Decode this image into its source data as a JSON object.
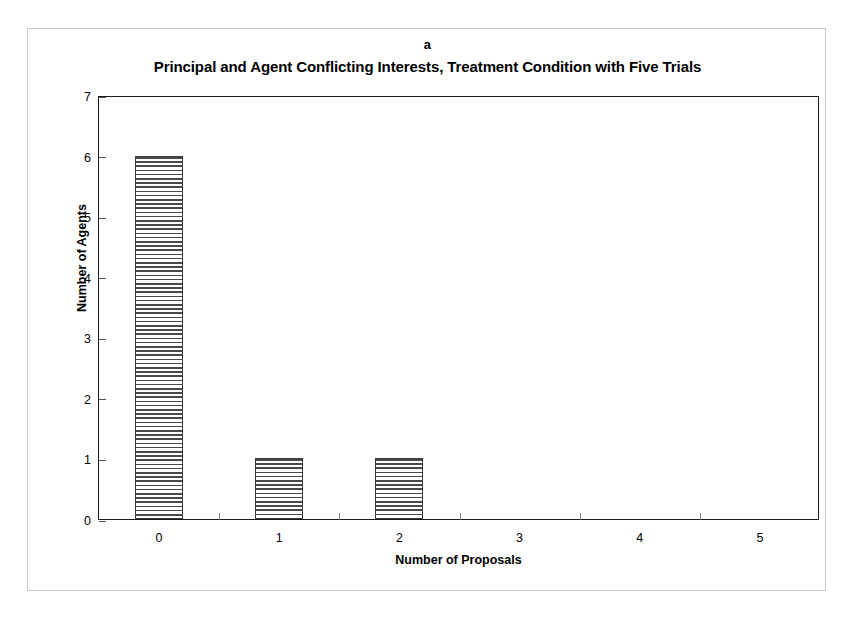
{
  "figure": {
    "panel_label": "a",
    "title": "Principal and Agent Conflicting Interests, Treatment Condition with Five Trials"
  },
  "chart_data": {
    "type": "bar",
    "title": "Principal and Agent Conflicting Interests, Treatment Condition with Five Trials",
    "panel_label": "a",
    "xlabel": "Number of Proposals",
    "ylabel": "Number of Agents",
    "categories": [
      "0",
      "1",
      "2",
      "3",
      "4",
      "5"
    ],
    "values": [
      6,
      1,
      1,
      0,
      0,
      0
    ],
    "ylim": [
      0,
      7
    ],
    "yticks": [
      "0",
      "1",
      "2",
      "3",
      "4",
      "5",
      "6",
      "7"
    ],
    "xtick_labels": [
      "0",
      "1",
      "2",
      "3",
      "4",
      "5"
    ],
    "grid": false,
    "legend": null,
    "bar_fill": "horizontal-hatch",
    "bar_edge_color": "#3a3a3a",
    "axis_color": "#1a1a1a",
    "background_color": "#ffffff"
  },
  "axes": {
    "y_title": "Number of Agents",
    "x_title": "Number of Proposals",
    "y_tick_0": "0",
    "y_tick_1": "1",
    "y_tick_2": "2",
    "y_tick_3": "3",
    "y_tick_4": "4",
    "y_tick_5": "5",
    "y_tick_6": "6",
    "y_tick_7": "7",
    "x_tick_0": "0",
    "x_tick_1": "1",
    "x_tick_2": "2",
    "x_tick_3": "3",
    "x_tick_4": "4",
    "x_tick_5": "5"
  }
}
